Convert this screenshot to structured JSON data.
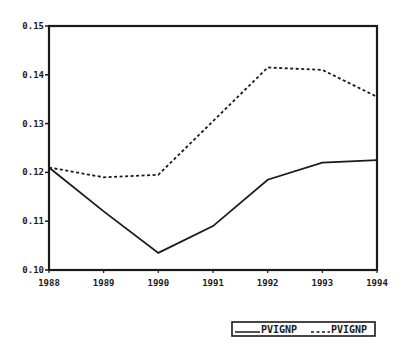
{
  "chart_data": {
    "type": "line",
    "title": "",
    "xlabel": "",
    "ylabel": "",
    "x": [
      "1988",
      "1989",
      "1990",
      "1991",
      "1992",
      "1993",
      "1994"
    ],
    "yticks": [
      "0.10",
      "0.11",
      "0.12",
      "0.13",
      "0.14",
      "0.15"
    ],
    "ylim": [
      0.1,
      0.15
    ],
    "grid": false,
    "legend_position": "bottom-right",
    "series": [
      {
        "name": "PVIGNP",
        "style": "solid",
        "values": [
          0.121,
          0.112,
          0.1035,
          0.109,
          0.1185,
          0.122,
          0.1225
        ]
      },
      {
        "name": "PVIGNP",
        "style": "dashed",
        "values": [
          0.121,
          0.119,
          0.1195,
          0.1305,
          0.1415,
          0.141,
          0.1355
        ]
      }
    ],
    "legend": [
      {
        "label": "PVIGNP",
        "style": "solid"
      },
      {
        "label": "PVIGNP",
        "style": "dashed"
      }
    ],
    "colors": {
      "ink": "#1a1a1a",
      "background": "#ffffff"
    }
  }
}
